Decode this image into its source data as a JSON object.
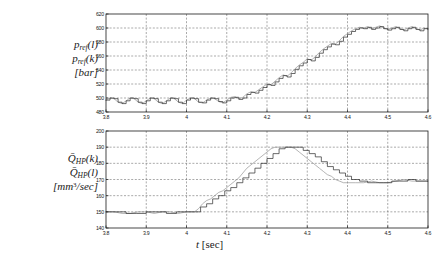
{
  "figure": {
    "xaxis_title_symbol": "t",
    "xaxis_title_unit": "[sec]"
  },
  "panels": {
    "top": {
      "label_line1_base": "p",
      "label_line1_sub": "ref",
      "label_line1_arg": "(l)",
      "label_line2_base": "p",
      "label_line2_sub": "ref",
      "label_line2_arg": "(k)",
      "label_line3": "[bar]"
    },
    "bottom": {
      "label_line1_base": "Q̄",
      "label_line1_sub": "HP",
      "label_line1_arg": "(k)",
      "label_line2_base": "Q̄",
      "label_line2_sub": "HP",
      "label_line2_arg": "(l)",
      "label_line3_pre": "[mm",
      "label_line3_sup": "3",
      "label_line3_post": "/sec]"
    }
  },
  "colors": {
    "continuous_trace": "#8c8c8c",
    "discrete_trace": "#2b2b2b",
    "grid": "#555555",
    "frame": "#1a1a1a",
    "background": "#ffffff"
  },
  "chart_data": [
    {
      "type": "line",
      "id": "p_ref_panel",
      "title": "",
      "xlabel": "t [sec]",
      "ylabel": "p_ref [bar]",
      "xlim": [
        3.8,
        4.6
      ],
      "ylim": [
        480,
        620
      ],
      "xticks": [
        3.8,
        3.9,
        4.0,
        4.1,
        4.2,
        4.3,
        4.4,
        4.5,
        4.6
      ],
      "xticklabels": [
        "3.8",
        "3.9",
        "4",
        "4.1",
        "4.2",
        "4.3",
        "4.4",
        "4.5",
        "4.6"
      ],
      "yticks": [
        480,
        500,
        520,
        540,
        560,
        580,
        600,
        620
      ],
      "yticklabels": [
        "480",
        "500",
        "520",
        "540",
        "560",
        "580",
        "600",
        "620"
      ],
      "grid": true,
      "legend": null,
      "series": [
        {
          "name": "p_ref(l)",
          "style": "continuous",
          "color": "#8c8c8c",
          "x": [
            3.8,
            3.81,
            3.82,
            3.83,
            3.84,
            3.85,
            3.86,
            3.87,
            3.88,
            3.89,
            3.9,
            3.91,
            3.92,
            3.93,
            3.94,
            3.95,
            3.96,
            3.97,
            3.98,
            3.99,
            4.0,
            4.01,
            4.02,
            4.03,
            4.04,
            4.05,
            4.06,
            4.07,
            4.08,
            4.09,
            4.1,
            4.11,
            4.12,
            4.13,
            4.14,
            4.15,
            4.16,
            4.17,
            4.18,
            4.19,
            4.2,
            4.21,
            4.22,
            4.23,
            4.24,
            4.25,
            4.26,
            4.27,
            4.28,
            4.29,
            4.3,
            4.31,
            4.32,
            4.33,
            4.34,
            4.35,
            4.36,
            4.37,
            4.38,
            4.39,
            4.4,
            4.41,
            4.42,
            4.43,
            4.44,
            4.45,
            4.46,
            4.47,
            4.48,
            4.49,
            4.5,
            4.51,
            4.52,
            4.53,
            4.54,
            4.55,
            4.56,
            4.57,
            4.58,
            4.59,
            4.6
          ],
          "y": [
            497,
            500,
            499,
            494,
            492,
            496,
            500,
            499,
            494,
            492,
            496,
            500,
            499,
            494,
            492,
            496,
            500,
            499,
            494,
            492,
            497,
            500,
            499,
            494,
            493,
            497,
            500,
            499,
            495,
            493,
            497,
            501,
            502,
            499,
            501,
            506,
            509,
            508,
            512,
            516,
            520,
            519,
            524,
            529,
            533,
            531,
            536,
            542,
            547,
            551,
            556,
            554,
            559,
            565,
            570,
            574,
            578,
            577,
            582,
            588,
            592,
            596,
            599,
            601,
            600,
            602,
            599,
            601,
            603,
            600,
            598,
            600,
            602,
            599,
            597,
            600,
            602,
            599,
            597,
            600,
            599
          ]
        },
        {
          "name": "p_ref(k)",
          "style": "stepped",
          "color": "#2b2b2b",
          "x": [
            3.8,
            3.81,
            3.82,
            3.83,
            3.84,
            3.85,
            3.86,
            3.87,
            3.88,
            3.89,
            3.9,
            3.91,
            3.92,
            3.93,
            3.94,
            3.95,
            3.96,
            3.97,
            3.98,
            3.99,
            4.0,
            4.01,
            4.02,
            4.03,
            4.04,
            4.05,
            4.06,
            4.07,
            4.08,
            4.09,
            4.1,
            4.11,
            4.12,
            4.13,
            4.14,
            4.15,
            4.16,
            4.17,
            4.18,
            4.19,
            4.2,
            4.21,
            4.22,
            4.23,
            4.24,
            4.25,
            4.26,
            4.27,
            4.28,
            4.29,
            4.3,
            4.31,
            4.32,
            4.33,
            4.34,
            4.35,
            4.36,
            4.37,
            4.38,
            4.39,
            4.4,
            4.41,
            4.42,
            4.43,
            4.44,
            4.45,
            4.46,
            4.47,
            4.48,
            4.49,
            4.5,
            4.51,
            4.52,
            4.53,
            4.54,
            4.55,
            4.56,
            4.57,
            4.58,
            4.59,
            4.6
          ],
          "y": [
            497,
            500,
            499,
            494,
            492,
            496,
            500,
            499,
            494,
            492,
            496,
            500,
            499,
            494,
            492,
            496,
            500,
            499,
            494,
            492,
            497,
            500,
            499,
            494,
            493,
            497,
            500,
            499,
            495,
            493,
            496,
            500,
            501,
            498,
            500,
            505,
            508,
            507,
            511,
            515,
            519,
            518,
            523,
            528,
            532,
            530,
            535,
            541,
            546,
            550,
            555,
            553,
            558,
            564,
            569,
            573,
            577,
            576,
            581,
            587,
            591,
            595,
            598,
            600,
            599,
            601,
            598,
            600,
            602,
            599,
            597,
            599,
            601,
            598,
            596,
            599,
            601,
            598,
            596,
            599,
            598
          ]
        }
      ]
    },
    {
      "type": "line",
      "id": "Q_HP_panel",
      "title": "",
      "xlabel": "t [sec]",
      "ylabel": "Q_HP [mm^3/sec]",
      "xlim": [
        3.8,
        4.6
      ],
      "ylim": [
        140,
        200
      ],
      "xticks": [
        3.8,
        3.9,
        4.0,
        4.1,
        4.2,
        4.3,
        4.4,
        4.5,
        4.6
      ],
      "xticklabels": [
        "3.8",
        "3.9",
        "4",
        "4.1",
        "4.2",
        "4.3",
        "4.4",
        "4.5",
        "4.6"
      ],
      "yticks": [
        140,
        150,
        160,
        170,
        180,
        190,
        200
      ],
      "yticklabels": [
        "140",
        "150",
        "160",
        "170",
        "180",
        "190",
        "200"
      ],
      "grid": true,
      "legend": null,
      "series": [
        {
          "name": "Q_HP(l)",
          "style": "continuous",
          "color": "#8c8c8c",
          "x": [
            3.8,
            3.82,
            3.84,
            3.86,
            3.88,
            3.9,
            3.92,
            3.94,
            3.96,
            3.98,
            4.0,
            4.02,
            4.03,
            4.04,
            4.05,
            4.06,
            4.07,
            4.08,
            4.09,
            4.1,
            4.11,
            4.12,
            4.13,
            4.14,
            4.15,
            4.16,
            4.17,
            4.18,
            4.19,
            4.2,
            4.21,
            4.22,
            4.23,
            4.24,
            4.25,
            4.26,
            4.27,
            4.28,
            4.29,
            4.3,
            4.31,
            4.32,
            4.33,
            4.34,
            4.35,
            4.36,
            4.37,
            4.38,
            4.39,
            4.4,
            4.42,
            4.44,
            4.46,
            4.48,
            4.5,
            4.52,
            4.54,
            4.56,
            4.58,
            4.6
          ],
          "y": [
            150,
            150,
            149,
            149,
            150,
            150,
            149,
            150,
            150,
            149,
            150,
            150,
            152,
            155,
            157,
            158,
            160,
            162,
            163,
            165,
            167,
            169,
            171,
            174,
            177,
            179,
            181,
            183,
            185,
            187,
            189,
            190,
            190,
            190,
            190,
            190,
            189,
            187,
            185,
            183,
            181,
            179,
            177,
            175,
            173,
            172,
            170,
            169,
            168,
            168,
            168,
            168,
            169,
            168,
            168,
            169,
            170,
            169,
            169,
            169
          ]
        },
        {
          "name": "Q_HP(k)",
          "style": "stepped",
          "color": "#2b2b2b",
          "x": [
            3.8,
            3.825,
            3.85,
            3.875,
            3.9,
            3.925,
            3.95,
            3.975,
            4.0,
            4.02,
            4.035,
            4.05,
            4.065,
            4.08,
            4.095,
            4.11,
            4.125,
            4.14,
            4.155,
            4.17,
            4.185,
            4.2,
            4.215,
            4.23,
            4.245,
            4.26,
            4.275,
            4.29,
            4.305,
            4.32,
            4.335,
            4.35,
            4.365,
            4.38,
            4.395,
            4.41,
            4.43,
            4.45,
            4.47,
            4.49,
            4.51,
            4.53,
            4.55,
            4.57,
            4.59,
            4.6
          ],
          "y": [
            150,
            150,
            149,
            149,
            150,
            150,
            149,
            150,
            150,
            150,
            153,
            155,
            158,
            160,
            163,
            165,
            168,
            171,
            174,
            177,
            180,
            183,
            186,
            189,
            190,
            190,
            190,
            188,
            186,
            184,
            181,
            178,
            176,
            174,
            172,
            170,
            169,
            168,
            168,
            168,
            169,
            169,
            170,
            169,
            169,
            169
          ]
        }
      ]
    }
  ]
}
